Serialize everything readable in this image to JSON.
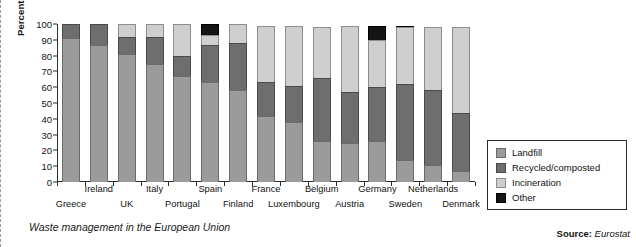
{
  "chart_data": {
    "type": "bar",
    "stacked": true,
    "title": "",
    "caption": "Waste management in the European Union",
    "xlabel": "",
    "ylabel": "Percentage of total waste",
    "ylim": [
      0,
      100
    ],
    "yticks": [
      0,
      10,
      20,
      30,
      40,
      50,
      60,
      70,
      80,
      90,
      100
    ],
    "grid": false,
    "legend_position": "right",
    "categories": [
      "Greece",
      "Ireland",
      "UK",
      "Italy",
      "Portugal",
      "Spain",
      "Finland",
      "France",
      "Luxembourg",
      "Belgium",
      "Austria",
      "Germany",
      "Sweden",
      "Netherlands",
      "Denmark"
    ],
    "series": [
      {
        "name": "Landfill",
        "color": "#9b9b9b",
        "values": [
          91,
          87,
          81,
          75,
          67,
          63,
          58,
          42,
          38,
          26,
          25,
          26,
          14,
          11,
          7
        ]
      },
      {
        "name": "Recycled/composted",
        "color": "#6e6e6e",
        "values": [
          9,
          13,
          11,
          17,
          13,
          24,
          30,
          21,
          23,
          40,
          32,
          34,
          48,
          47,
          37
        ]
      },
      {
        "name": "Incineration",
        "color": "#cfcfcf",
        "values": [
          0,
          0,
          8,
          8,
          20,
          6,
          12,
          36,
          38,
          32,
          42,
          30,
          36,
          40,
          54
        ]
      },
      {
        "name": "Other",
        "color": "#141414",
        "values": [
          0,
          0,
          0,
          0,
          0,
          7,
          0,
          0,
          0,
          0,
          0,
          9,
          1,
          0,
          0
        ]
      }
    ],
    "source_label": "Source:",
    "source_value": "Eurostat"
  },
  "legend": {
    "items": [
      {
        "label": "Landfill",
        "swatch": "landfill-swatch"
      },
      {
        "label": "Recycled/composted",
        "swatch": "recycled-swatch"
      },
      {
        "label": "Incineration",
        "swatch": "incineration-swatch"
      },
      {
        "label": "Other",
        "swatch": "other-swatch"
      }
    ]
  }
}
